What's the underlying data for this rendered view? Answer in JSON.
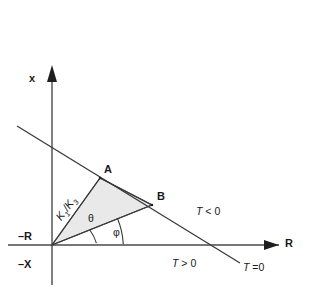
{
  "figure": {
    "type": "geometric-diagram",
    "background_color": "#ffffff",
    "line_color": "#3a3a3a",
    "fill_color": "#e9e9e9",
    "width": 316,
    "height": 289
  },
  "axes": {
    "vertical_label": "x",
    "vertical_negative_label": "–X",
    "horizontal_label": "R",
    "horizontal_negative_label": "–R",
    "origin": {
      "x": 52,
      "y": 245
    }
  },
  "points": [
    {
      "name": "A",
      "label": "A",
      "x": 100,
      "y": 178
    },
    {
      "name": "B",
      "label": "B",
      "x": 152,
      "y": 205
    }
  ],
  "angles": [
    {
      "name": "theta",
      "label": "θ"
    },
    {
      "name": "phi",
      "label": "φ"
    }
  ],
  "annotations": {
    "ratio_label": "K",
    "ratio_sub1": "1",
    "ratio_slash": "/K",
    "ratio_sub2": "3",
    "region_negative": "T < 0",
    "region_positive": "T > 0",
    "boundary_line": "T =0",
    "boundary_italic": "T",
    "boundary_rest": " =0",
    "negative_italic": "T",
    "negative_rest": " < 0",
    "positive_italic": "T",
    "positive_rest": " > 0"
  }
}
